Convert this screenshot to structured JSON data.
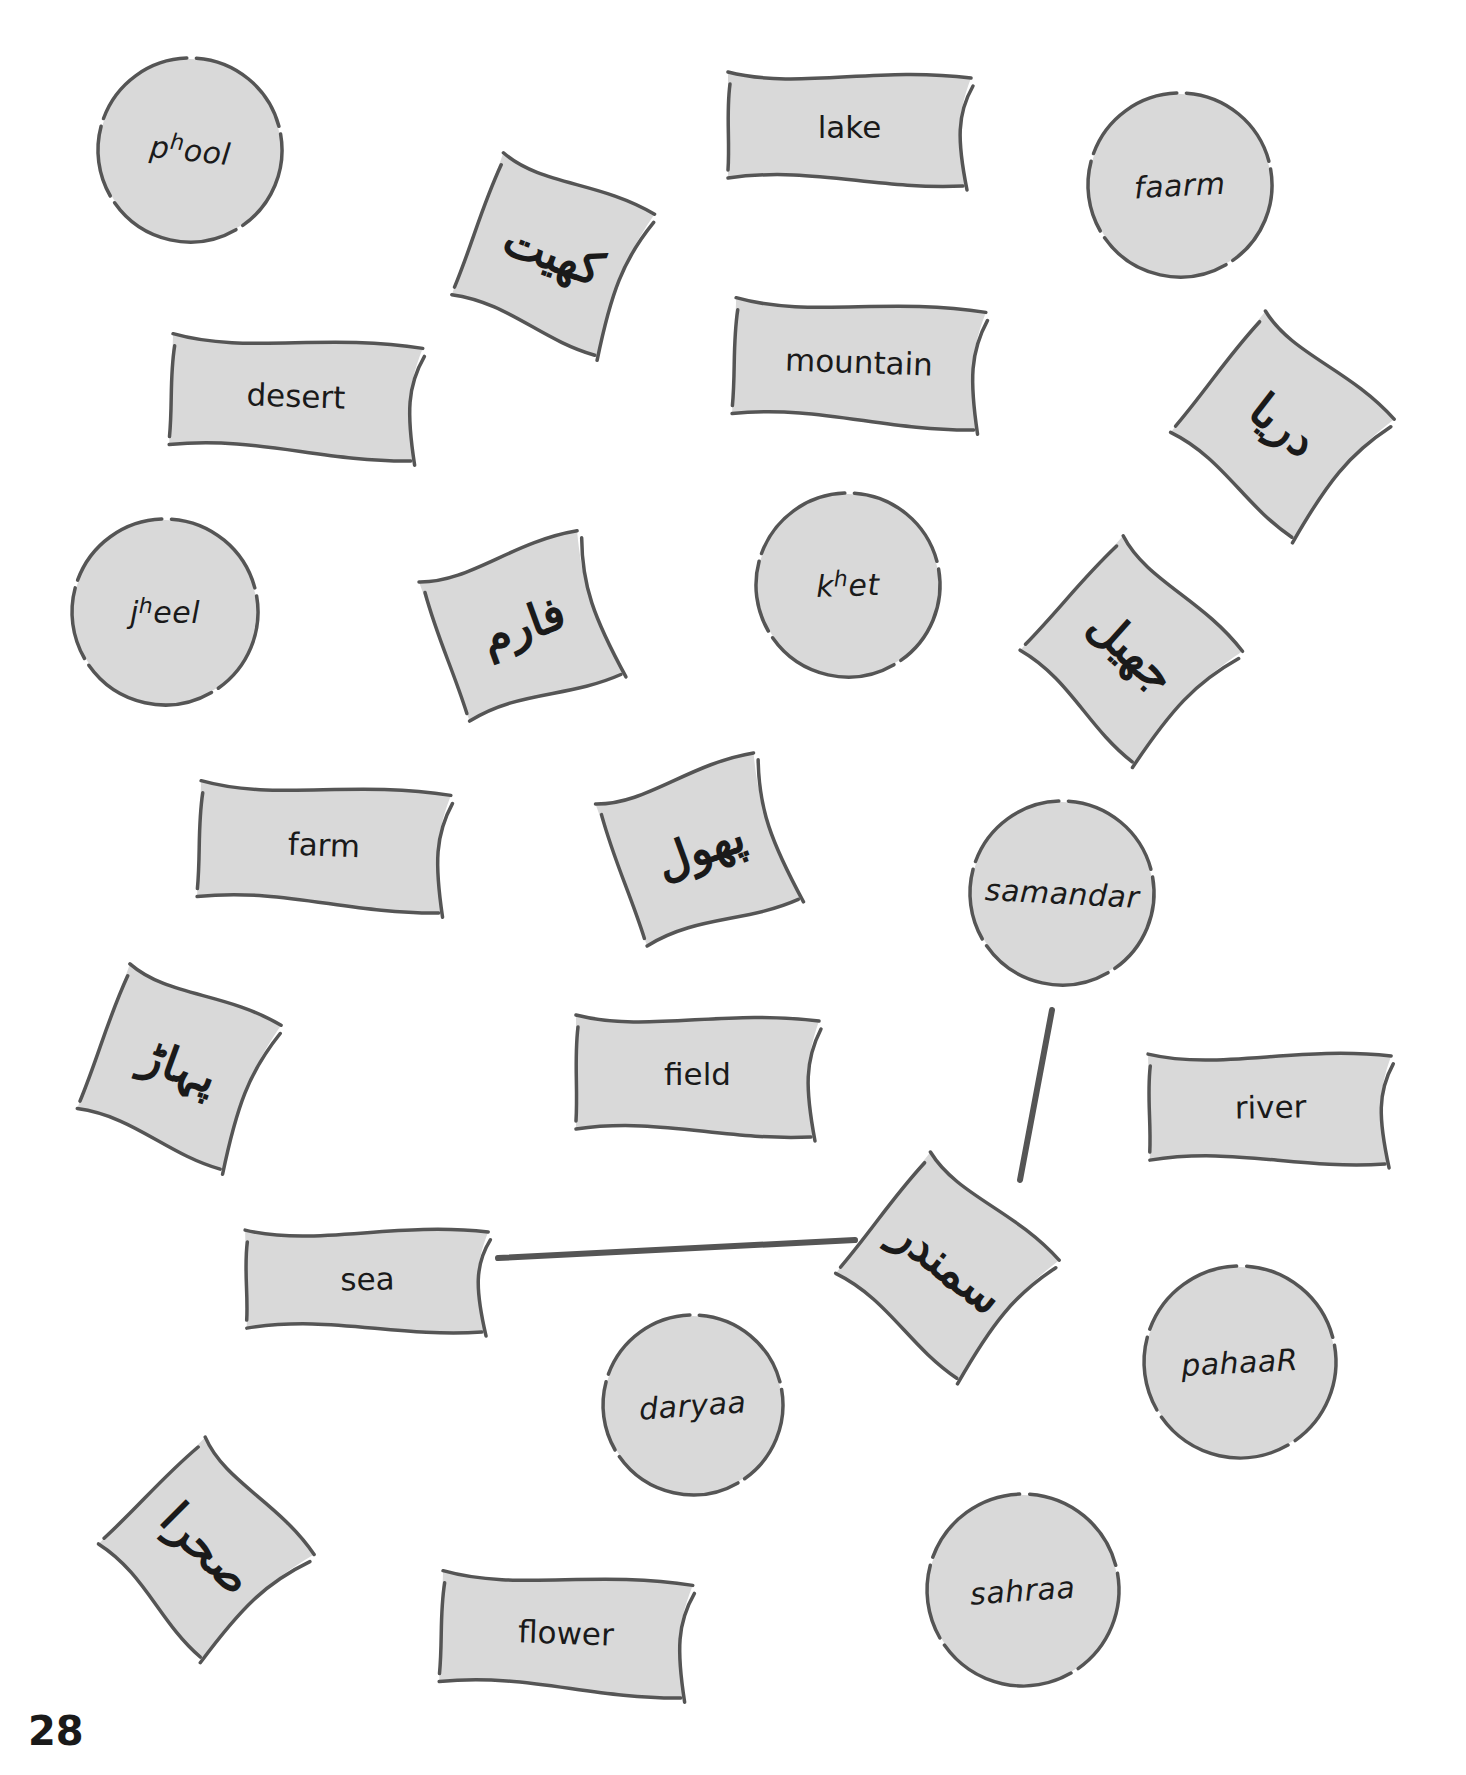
{
  "page": {
    "number": "28",
    "colors": {
      "card_fill": "#d9d9d9",
      "card_stroke": "#555555",
      "connector": "#555555",
      "text": "#1a1a1a",
      "background": "#ffffff"
    }
  },
  "cards": {
    "circles": [
      {
        "id": "phool",
        "base": "p",
        "sup": "h",
        "rest": "ool",
        "cx": 190,
        "cy": 150,
        "r": 92,
        "rot": 6
      },
      {
        "id": "faarm",
        "base": "faarm",
        "sup": "",
        "rest": "",
        "cx": 1180,
        "cy": 185,
        "r": 92,
        "rot": -3
      },
      {
        "id": "jheel",
        "base": "j",
        "sup": "h",
        "rest": "eel",
        "cx": 165,
        "cy": 612,
        "r": 93,
        "rot": 0
      },
      {
        "id": "khet",
        "base": "k",
        "sup": "h",
        "rest": "et",
        "cx": 848,
        "cy": 585,
        "r": 92,
        "rot": -2
      },
      {
        "id": "samandar",
        "base": "samandar",
        "sup": "",
        "rest": "",
        "cx": 1062,
        "cy": 893,
        "r": 92,
        "rot": 3
      },
      {
        "id": "pahaaR",
        "base": "pahaaR",
        "sup": "",
        "rest": "",
        "cx": 1240,
        "cy": 1362,
        "r": 96,
        "rot": -3
      },
      {
        "id": "daryaa",
        "base": "daryaa",
        "sup": "",
        "rest": "",
        "cx": 693,
        "cy": 1405,
        "r": 90,
        "rot": -4
      },
      {
        "id": "sahraa",
        "base": "sahraa",
        "sup": "",
        "rest": "",
        "cx": 1023,
        "cy": 1590,
        "r": 96,
        "rot": -4
      }
    ],
    "english": [
      {
        "id": "lake",
        "text": "lake",
        "x": 722,
        "y": 62,
        "w": 255,
        "h": 130,
        "rot": 0
      },
      {
        "id": "desert",
        "text": "desert",
        "x": 165,
        "y": 328,
        "w": 262,
        "h": 135,
        "rot": 2
      },
      {
        "id": "mountain",
        "text": "mountain",
        "x": 728,
        "y": 292,
        "w": 262,
        "h": 140,
        "rot": 2
      },
      {
        "id": "farm",
        "text": "farm",
        "x": 193,
        "y": 775,
        "w": 262,
        "h": 140,
        "rot": 2
      },
      {
        "id": "field",
        "text": "field",
        "x": 570,
        "y": 1005,
        "w": 255,
        "h": 138,
        "rot": 0
      },
      {
        "id": "river",
        "text": "river",
        "x": 1143,
        "y": 1042,
        "w": 255,
        "h": 130,
        "rot": -1
      },
      {
        "id": "sea",
        "text": "sea",
        "x": 240,
        "y": 1218,
        "w": 255,
        "h": 122,
        "rot": -1
      },
      {
        "id": "flower",
        "text": "flower",
        "x": 435,
        "y": 1565,
        "w": 262,
        "h": 135,
        "rot": 2
      }
    ],
    "urdu": [
      {
        "id": "khet_ur",
        "text": "کھیت",
        "cx": 553,
        "cy": 253,
        "w": 175,
        "h": 175,
        "rot": 20
      },
      {
        "id": "daryaa_ur",
        "text": "دریا",
        "cx": 1283,
        "cy": 425,
        "w": 180,
        "h": 178,
        "rot": 38
      },
      {
        "id": "faarm_ur",
        "text": "فارم",
        "cx": 523,
        "cy": 625,
        "w": 178,
        "h": 172,
        "rot": -20
      },
      {
        "id": "jheel_ur",
        "text": "جھیل",
        "cx": 1132,
        "cy": 650,
        "w": 178,
        "h": 178,
        "rot": 42
      },
      {
        "id": "phool_ur",
        "text": "پھول",
        "cx": 700,
        "cy": 848,
        "w": 178,
        "h": 175,
        "rot": -20
      },
      {
        "id": "pahaaR_ur",
        "text": "پہاڑ",
        "cx": 179,
        "cy": 1066,
        "w": 175,
        "h": 178,
        "rot": 20
      },
      {
        "id": "samandar_ur",
        "text": "سمندر",
        "cx": 948,
        "cy": 1266,
        "w": 180,
        "h": 178,
        "rot": 38
      },
      {
        "id": "sahraa_ur",
        "text": "صحرا",
        "cx": 207,
        "cy": 1548,
        "w": 172,
        "h": 175,
        "rot": 45
      }
    ]
  },
  "connectors": [
    {
      "from": "sea",
      "to": "samandar_ur",
      "x1": 498,
      "y1": 1258,
      "x2": 855,
      "y2": 1240
    },
    {
      "from": "samandar",
      "to": "samandar_ur",
      "x1": 1052,
      "y1": 1010,
      "x2": 1020,
      "y2": 1180
    }
  ]
}
